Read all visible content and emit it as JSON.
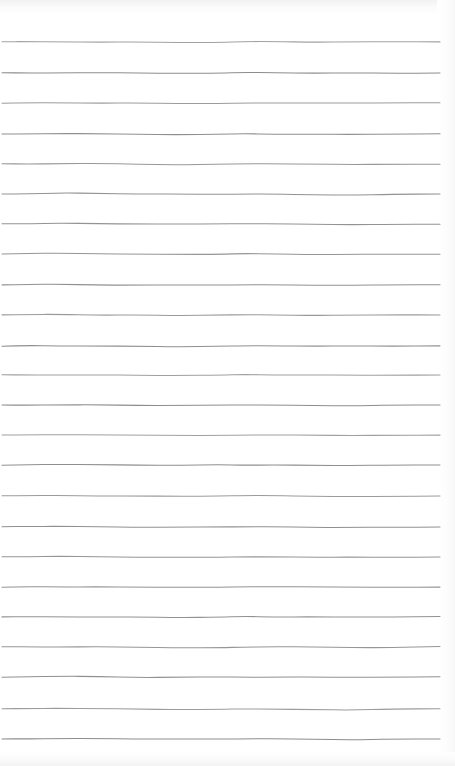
{
  "document": {
    "kind": "scanned-lined-paper",
    "title": "Blank Ruled Notebook Page",
    "body_text": "",
    "page_width": 455,
    "page_height": 766,
    "background_color": "#ffffff",
    "rule_color": "#8b8b8b",
    "rule_thickness_px": 1,
    "rule_count": 24,
    "rule_start_x": 2,
    "rule_end_x": 440,
    "first_rule_y": 42,
    "rule_spacing_px": 30.3,
    "left_margin_px": 2,
    "right_margin_px": 15,
    "top_margin_px": 42,
    "bottom_margin_px": 27,
    "has_margin_rule": false,
    "has_header": false,
    "has_handwriting": false,
    "rule_y_positions": [
      42,
      73,
      103,
      134,
      164,
      194,
      224,
      254,
      285,
      315,
      346,
      375,
      405,
      435,
      465,
      496,
      527,
      557,
      587,
      617,
      647,
      677,
      709,
      739
    ],
    "rule_waviness": [
      [
        0,
        0.0
      ],
      [
        0.06,
        -0.6
      ],
      [
        0.13,
        -0.9
      ],
      [
        0.22,
        -0.4
      ],
      [
        0.31,
        0.3
      ],
      [
        0.4,
        0.7
      ],
      [
        0.5,
        0.4
      ],
      [
        0.55,
        -0.5
      ],
      [
        0.62,
        -0.2
      ],
      [
        0.71,
        0.5
      ],
      [
        0.8,
        0.8
      ],
      [
        0.89,
        0.3
      ],
      [
        1.0,
        -0.2
      ]
    ]
  }
}
